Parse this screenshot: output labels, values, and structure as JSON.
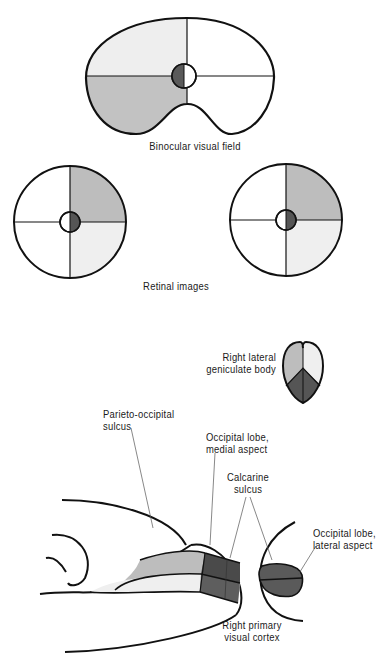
{
  "colors": {
    "outline": "#111111",
    "light": "#efefef",
    "medium": "#bdbdbd",
    "dark": "#5e5e5e",
    "darker": "#4a4a4a",
    "leader": "#555555"
  },
  "labels": {
    "binocular_field": "Binocular visual field",
    "retinal_images": "Retinal images",
    "geniculate": {
      "line1": "Right lateral",
      "line2": "geniculate body"
    },
    "parieto_occipital": {
      "line1": "Parieto-occipital",
      "line2": "sulcus"
    },
    "occipital_medial": {
      "line1": "Occipital lobe,",
      "line2": "medial aspect"
    },
    "calcarine": {
      "line1": "Calcarine",
      "line2": "sulcus"
    },
    "occipital_lateral": {
      "line1": "Occipital lobe,",
      "line2": "lateral aspect"
    },
    "primary_cortex": {
      "line1": "Right primary",
      "line2": "visual cortex"
    }
  },
  "figure": {
    "binocular_field": {
      "quadrants": {
        "upper_left": "light",
        "lower_left": "medium",
        "upper_right": "none",
        "lower_right": "none"
      },
      "fovea": {
        "left_upper": "dark",
        "left_lower": "dark"
      }
    },
    "retinal_left": {
      "quadrants": {
        "upper_right": "medium",
        "lower_right": "light"
      },
      "fovea": "right-half-dark"
    },
    "retinal_right": {
      "quadrants": {
        "upper_right": "medium",
        "lower_right": "light"
      },
      "fovea": "right-half-dark"
    },
    "geniculate": {
      "upper_left": "medium",
      "upper_right": "light",
      "bottom": "dark"
    }
  }
}
